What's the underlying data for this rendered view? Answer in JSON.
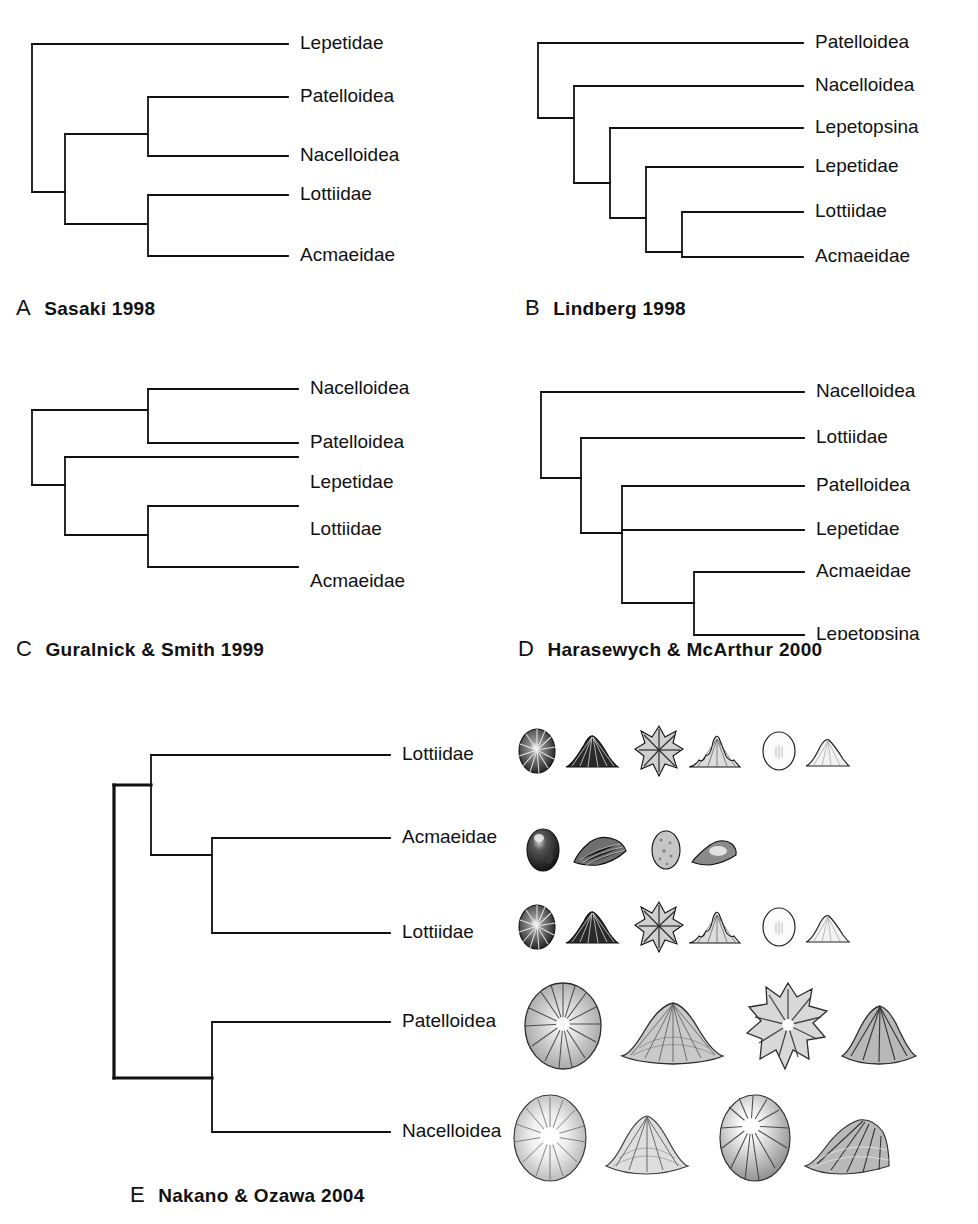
{
  "figure": {
    "background_color": "#ffffff",
    "line_color": "#111111",
    "text_color": "#111111"
  },
  "panels": [
    {
      "id": "A",
      "letter": "A",
      "caption": "Sasaki  1998",
      "tips": [
        "Lepetidae",
        "Patelloidea",
        "Nacelloidea",
        "Lottiidae",
        "Acmaeidae"
      ],
      "topology": "(Lepetidae,((Patelloidea,Nacelloidea),(Lottiidae,Acmaeidae)))"
    },
    {
      "id": "B",
      "letter": "B",
      "caption": "Lindberg  1998",
      "tips": [
        "Patelloidea",
        "Nacelloidea",
        "Lepetopsina",
        "Lepetidae",
        "Lottiidae",
        "Acmaeidae"
      ],
      "topology": "(Patelloidea,(Nacelloidea,(Lepetopsina,(Lepetidae,(Lottiidae,Acmaeidae)))))"
    },
    {
      "id": "C",
      "letter": "C",
      "caption": "Guralnick & Smith  1999",
      "tips": [
        "Nacelloidea",
        "Patelloidea",
        "Lepetidae",
        "Lottiidae",
        "Acmaeidae"
      ],
      "topology": "((Nacelloidea,Patelloidea),(Lepetidae,(Lottiidae,Acmaeidae)))"
    },
    {
      "id": "D",
      "letter": "D",
      "caption": "Harasewych & McArthur  2000",
      "tips": [
        "Nacelloidea",
        "Lottiidae",
        "Patelloidea",
        "Lepetidae",
        "Acmaeidae",
        "Lepetopsina"
      ],
      "topology": "(Nacelloidea,(Lottiidae,(Patelloidea,(Lepetidae,(Acmaeidae,Lepetopsina)))))"
    },
    {
      "id": "E",
      "letter": "E",
      "caption": "Nakano & Ozawa  2004",
      "tips": [
        "Lottiidae",
        "Acmaeidae",
        "Lottiidae",
        "Patelloidea",
        "Nacelloidea"
      ],
      "topology": "((Lottiidae,(Acmaeidae,Lottiidae)),(Patelloidea,Nacelloidea))"
    }
  ],
  "shell_rows": [
    {
      "taxon": "Lottiidae",
      "shell_count": 6,
      "size": "small"
    },
    {
      "taxon": "Acmaeidae",
      "shell_count": 4,
      "size": "small"
    },
    {
      "taxon": "Lottiidae",
      "shell_count": 6,
      "size": "small"
    },
    {
      "taxon": "Patelloidea",
      "shell_count": 4,
      "size": "large"
    },
    {
      "taxon": "Nacelloidea",
      "shell_count": 4,
      "size": "large"
    }
  ]
}
